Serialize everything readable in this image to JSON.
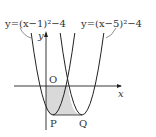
{
  "diagram": {
    "type": "parabola-graph",
    "curves": [
      {
        "label": "y=(x−1)²−4",
        "equation": "y=(x-1)^2-4",
        "vertex": [
          1,
          -4
        ],
        "vertex_label": "P"
      },
      {
        "label": "y=(x−5)²−4",
        "equation": "y=(x-5)^2-4",
        "vertex": [
          5,
          -4
        ],
        "vertex_label": "Q"
      }
    ],
    "labels": {
      "origin": "O",
      "x_axis": "x",
      "y_axis": "y",
      "p": "P",
      "q": "Q",
      "curve1": "y=(x−1)²−4",
      "curve2": "y=(x−5)²−4"
    },
    "shaded_region": "bounded by y-axis, x-axis, both parabolas and segment PQ",
    "colors": {
      "line": "#222222",
      "shade": "#d9d9d9"
    }
  }
}
